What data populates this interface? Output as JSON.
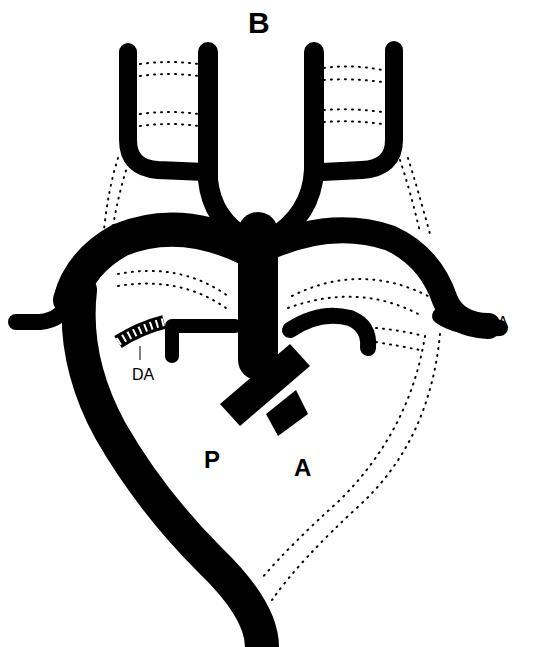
{
  "figure": {
    "panel_label": "B",
    "colors": {
      "vessel": "#000000",
      "background": "#ffffff",
      "dotted": "#000000"
    },
    "labels": {
      "lsa": "LSA",
      "da": "DA",
      "p": "P",
      "a": "A"
    },
    "structures": [
      {
        "name": "aortic-arch",
        "style": "solid"
      },
      {
        "name": "descending-aorta",
        "style": "solid"
      },
      {
        "name": "right-carotid-branch",
        "style": "solid"
      },
      {
        "name": "left-carotid-branch",
        "style": "solid"
      },
      {
        "name": "right-subclavian",
        "style": "solid"
      },
      {
        "name": "left-subclavian-artery",
        "style": "solid"
      },
      {
        "name": "ductus-arteriosus",
        "style": "hatched"
      },
      {
        "name": "pulmonary-trunk",
        "style": "solid"
      },
      {
        "name": "ascending-aorta",
        "style": "solid"
      },
      {
        "name": "regressed-vessels",
        "style": "dotted"
      }
    ]
  }
}
